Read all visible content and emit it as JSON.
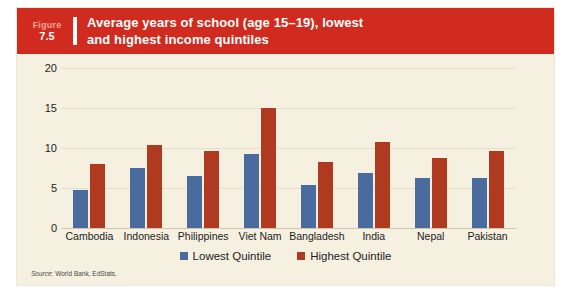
{
  "figure": {
    "label_word": "Figure",
    "number": "7.5",
    "title": "Average years of school (age 15–19), lowest\nand highest income quintiles"
  },
  "source": {
    "prefix": "Source:",
    "text": "World Bank, EdStats."
  },
  "colors": {
    "banner": "#d02b1e",
    "card_background": "#f6f0e1",
    "lowest_quintile": "#4a6b9e",
    "highest_quintile": "#b03a20",
    "gridline": "#e8dfcb"
  },
  "chart_data": {
    "type": "bar",
    "title": "Average years of school (age 15–19), lowest and highest income quintiles",
    "xlabel": "",
    "ylabel": "",
    "ylim": [
      0,
      20
    ],
    "yticks": [
      0,
      5,
      10,
      15,
      20
    ],
    "grid": true,
    "legend_position": "bottom-center",
    "categories": [
      "Cambodia",
      "Indonesia",
      "Philippines",
      "Viet Nam",
      "Bangladesh",
      "India",
      "Nepal",
      "Pakistan"
    ],
    "series": [
      {
        "name": "Lowest Quintile",
        "color": "#4a6b9e",
        "values": [
          4.7,
          7.5,
          6.5,
          9.3,
          5.4,
          6.9,
          6.2,
          6.3
        ]
      },
      {
        "name": "Highest Quintile",
        "color": "#b03a20",
        "values": [
          8.0,
          10.4,
          9.6,
          15.0,
          8.2,
          10.7,
          8.8,
          9.6
        ]
      }
    ]
  }
}
